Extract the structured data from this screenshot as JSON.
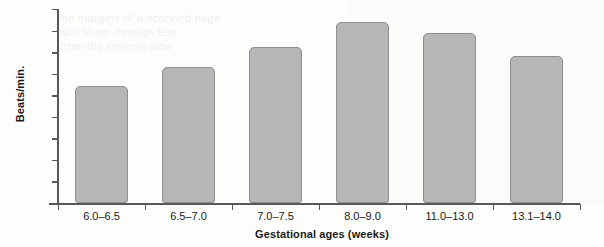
{
  "chart_data": {
    "type": "bar",
    "title": "",
    "xlabel": "Gestational ages (weeks)",
    "ylabel": "Beats/min.",
    "categories": [
      "6.0–6.5",
      "6.5–7.0",
      "7.0–7.5",
      "8.0–9.0",
      "11.0–13.0",
      "13.1–14.0"
    ],
    "values": [
      109,
      126,
      145,
      168,
      158,
      136
    ],
    "ylim": [
      0,
      180
    ],
    "yticks": [
      0,
      20,
      40,
      60,
      80,
      100,
      120,
      140,
      160,
      180
    ],
    "ytick_labels": [
      "0",
      "20",
      "40",
      "60",
      "80",
      "100",
      "120",
      "140",
      "160",
      "180"
    ],
    "grid": false,
    "legend": null,
    "bar_color": "#b6b6b6",
    "bar_border_color": "#8e8e8e",
    "axis_color": "#58585a"
  },
  "bleed_text": [
    "the margins of a scanned page",
    "faint show-through text",
    "from the reverse side"
  ]
}
